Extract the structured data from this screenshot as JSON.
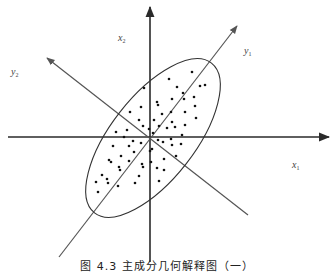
{
  "figure": {
    "caption": "图 4.3   主成分几何解释图（一）",
    "labels": {
      "x1": {
        "base": "x",
        "sub": "1"
      },
      "x2": {
        "base": "x",
        "sub": "2"
      },
      "y1": {
        "base": "y",
        "sub": "1"
      },
      "y2": {
        "base": "y",
        "sub": "2"
      }
    },
    "colors": {
      "axis": "#2a2a2a",
      "rotated_axis": "#555555",
      "ellipse": "#333333",
      "point": "#111111"
    },
    "origin": [
      150,
      137
    ],
    "ellipse": {
      "cx": 153,
      "cy": 138,
      "rx": 95,
      "ry": 42,
      "rotation_deg": -52
    },
    "points": [
      [
        192,
        72
      ],
      [
        169,
        79
      ],
      [
        144,
        88
      ],
      [
        177,
        87
      ],
      [
        200,
        86
      ],
      [
        205,
        85
      ],
      [
        183,
        93
      ],
      [
        184,
        99
      ],
      [
        172,
        99
      ],
      [
        157,
        102
      ],
      [
        158,
        105
      ],
      [
        141,
        107
      ],
      [
        194,
        97
      ],
      [
        195,
        106
      ],
      [
        130,
        112
      ],
      [
        185,
        112
      ],
      [
        162,
        114
      ],
      [
        171,
        112
      ],
      [
        196,
        118
      ],
      [
        139,
        120
      ],
      [
        154,
        120
      ],
      [
        172,
        122
      ],
      [
        143,
        126
      ],
      [
        159,
        126
      ],
      [
        167,
        128
      ],
      [
        175,
        127
      ],
      [
        185,
        125
      ],
      [
        127,
        130
      ],
      [
        116,
        132
      ],
      [
        149,
        129
      ],
      [
        153,
        133
      ],
      [
        182,
        135
      ],
      [
        124,
        137
      ],
      [
        133,
        141
      ],
      [
        141,
        143
      ],
      [
        158,
        140
      ],
      [
        163,
        142
      ],
      [
        171,
        139
      ],
      [
        172,
        145
      ],
      [
        181,
        144
      ],
      [
        113,
        146
      ],
      [
        129,
        146
      ],
      [
        134,
        152
      ],
      [
        121,
        156
      ],
      [
        152,
        149
      ],
      [
        150,
        151
      ],
      [
        109,
        160
      ],
      [
        111,
        162
      ],
      [
        129,
        161
      ],
      [
        151,
        162
      ],
      [
        164,
        159
      ],
      [
        176,
        156
      ],
      [
        142,
        164
      ],
      [
        143,
        167
      ],
      [
        119,
        167
      ],
      [
        120,
        170
      ],
      [
        157,
        168
      ],
      [
        164,
        170
      ],
      [
        102,
        175
      ],
      [
        139,
        176
      ],
      [
        107,
        179
      ],
      [
        108,
        183
      ],
      [
        96,
        182
      ],
      [
        118,
        186
      ],
      [
        135,
        183
      ],
      [
        159,
        181
      ],
      [
        98,
        192
      ]
    ]
  }
}
